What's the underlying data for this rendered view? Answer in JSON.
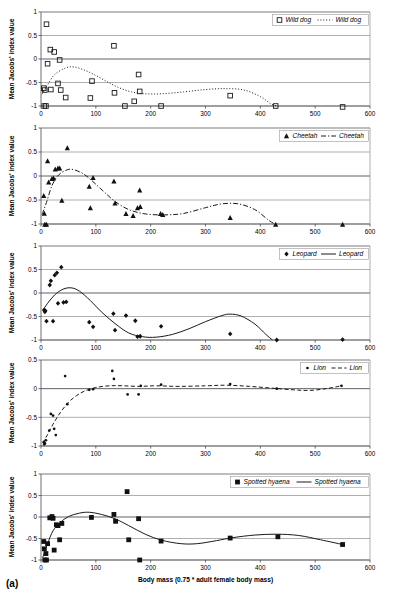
{
  "figure": {
    "caption": "(a)",
    "xlabel": "Body mass (0.75 * adult female body mass)",
    "ylabel": "Mean Jacobs' index value"
  },
  "axes": {
    "x_ticks": [
      "0",
      "100",
      "200",
      "300",
      "400",
      "500",
      "600"
    ],
    "x_values": [
      0,
      100,
      200,
      300,
      400,
      500,
      600
    ],
    "y_ticks_full": [
      "1",
      "0.5",
      "0",
      "-0.5",
      "-1"
    ],
    "y_values_full": [
      1,
      0.5,
      0,
      -0.5,
      -1
    ],
    "y_ticks_lion": [
      "0.5",
      "0",
      "-0.5",
      "-1"
    ],
    "y_values_lion": [
      0.5,
      0,
      -0.5,
      -1
    ]
  },
  "chart_data": [
    {
      "type": "scatter",
      "panel": 1,
      "title": "",
      "xlabel": "",
      "ylabel": "Mean Jacobs' index value",
      "xlim": [
        0,
        600
      ],
      "ylim": [
        -1,
        1
      ],
      "grid": true,
      "legend_position": "top-right",
      "legend": [
        {
          "label": "Wild dog",
          "kind": "marker",
          "marker": "open-square"
        },
        {
          "label": "Wild dog",
          "kind": "line",
          "linestyle": "dotted"
        }
      ],
      "marker": "open-square",
      "linestyle": "dotted",
      "points": [
        {
          "x": 10,
          "y": 0.74
        },
        {
          "x": 12,
          "y": -0.1
        },
        {
          "x": 17,
          "y": 0.2
        },
        {
          "x": 24,
          "y": 0.15
        },
        {
          "x": 34,
          "y": -0.02
        },
        {
          "x": 5,
          "y": -0.62
        },
        {
          "x": 7,
          "y": -0.66
        },
        {
          "x": 6,
          "y": -1.0
        },
        {
          "x": 9,
          "y": -1.0
        },
        {
          "x": 18,
          "y": -0.65
        },
        {
          "x": 31,
          "y": -0.52
        },
        {
          "x": 36,
          "y": -0.66
        },
        {
          "x": 45,
          "y": -0.82
        },
        {
          "x": 90,
          "y": -0.83
        },
        {
          "x": 93,
          "y": -0.47
        },
        {
          "x": 133,
          "y": 0.28
        },
        {
          "x": 134,
          "y": -0.72
        },
        {
          "x": 153,
          "y": -1.0
        },
        {
          "x": 170,
          "y": -0.9
        },
        {
          "x": 178,
          "y": -0.33
        },
        {
          "x": 180,
          "y": -0.69
        },
        {
          "x": 219,
          "y": -1.0
        },
        {
          "x": 345,
          "y": -0.78
        },
        {
          "x": 428,
          "y": -1.0
        },
        {
          "x": 550,
          "y": -1.02
        }
      ],
      "curve": [
        {
          "x": 2,
          "y": -0.75
        },
        {
          "x": 12,
          "y": -0.55
        },
        {
          "x": 25,
          "y": -0.33
        },
        {
          "x": 45,
          "y": -0.19
        },
        {
          "x": 60,
          "y": -0.17
        },
        {
          "x": 80,
          "y": -0.24
        },
        {
          "x": 100,
          "y": -0.35
        },
        {
          "x": 120,
          "y": -0.48
        },
        {
          "x": 140,
          "y": -0.6
        },
        {
          "x": 165,
          "y": -0.7
        },
        {
          "x": 190,
          "y": -0.74
        },
        {
          "x": 220,
          "y": -0.74
        },
        {
          "x": 260,
          "y": -0.7
        },
        {
          "x": 300,
          "y": -0.65
        },
        {
          "x": 335,
          "y": -0.63
        },
        {
          "x": 370,
          "y": -0.66
        },
        {
          "x": 400,
          "y": -0.8
        },
        {
          "x": 420,
          "y": -0.96
        },
        {
          "x": 432,
          "y": -1.0
        }
      ]
    },
    {
      "type": "scatter",
      "panel": 2,
      "title": "",
      "xlabel": "",
      "ylabel": "Mean Jacobs' index value",
      "xlim": [
        0,
        600
      ],
      "ylim": [
        -1,
        1
      ],
      "grid": true,
      "legend_position": "top-right",
      "legend": [
        {
          "label": "Cheetah",
          "kind": "marker",
          "marker": "filled-triangle"
        },
        {
          "label": "Cheetah",
          "kind": "line",
          "linestyle": "dash-dot"
        }
      ],
      "marker": "filled-triangle",
      "linestyle": "dash-dot",
      "points": [
        {
          "x": 5,
          "y": -0.41
        },
        {
          "x": 6,
          "y": -0.78
        },
        {
          "x": 7,
          "y": -1.01
        },
        {
          "x": 10,
          "y": -1.01
        },
        {
          "x": 12,
          "y": 0.31
        },
        {
          "x": 14,
          "y": -0.13
        },
        {
          "x": 20,
          "y": -0.06
        },
        {
          "x": 23,
          "y": -0.05
        },
        {
          "x": 26,
          "y": 0.14
        },
        {
          "x": 31,
          "y": 0.16
        },
        {
          "x": 34,
          "y": 0.16
        },
        {
          "x": 38,
          "y": -0.51
        },
        {
          "x": 48,
          "y": 0.58
        },
        {
          "x": 88,
          "y": -0.22
        },
        {
          "x": 90,
          "y": -0.67
        },
        {
          "x": 95,
          "y": -0.04
        },
        {
          "x": 133,
          "y": -0.11
        },
        {
          "x": 135,
          "y": -0.57
        },
        {
          "x": 155,
          "y": -0.79
        },
        {
          "x": 168,
          "y": -0.83
        },
        {
          "x": 176,
          "y": -0.67
        },
        {
          "x": 180,
          "y": -0.3
        },
        {
          "x": 181,
          "y": -0.64
        },
        {
          "x": 218,
          "y": -0.79
        },
        {
          "x": 222,
          "y": -0.81
        },
        {
          "x": 345,
          "y": -0.87
        },
        {
          "x": 428,
          "y": -1.01
        },
        {
          "x": 550,
          "y": -1.01
        }
      ],
      "curve": [
        {
          "x": 2,
          "y": -0.8
        },
        {
          "x": 10,
          "y": -0.55
        },
        {
          "x": 20,
          "y": -0.2
        },
        {
          "x": 32,
          "y": 0.02
        },
        {
          "x": 48,
          "y": 0.13
        },
        {
          "x": 60,
          "y": 0.13
        },
        {
          "x": 78,
          "y": 0.04
        },
        {
          "x": 95,
          "y": -0.12
        },
        {
          "x": 115,
          "y": -0.33
        },
        {
          "x": 135,
          "y": -0.53
        },
        {
          "x": 160,
          "y": -0.7
        },
        {
          "x": 190,
          "y": -0.79
        },
        {
          "x": 225,
          "y": -0.81
        },
        {
          "x": 260,
          "y": -0.78
        },
        {
          "x": 300,
          "y": -0.66
        },
        {
          "x": 330,
          "y": -0.58
        },
        {
          "x": 360,
          "y": -0.58
        },
        {
          "x": 390,
          "y": -0.7
        },
        {
          "x": 415,
          "y": -0.92
        },
        {
          "x": 428,
          "y": -1.01
        }
      ]
    },
    {
      "type": "scatter",
      "panel": 3,
      "title": "",
      "xlabel": "",
      "ylabel": "Mean Jacobs' index value",
      "xlim": [
        0,
        600
      ],
      "ylim": [
        -1,
        1
      ],
      "grid": true,
      "legend_position": "top-right",
      "legend": [
        {
          "label": "Leopard",
          "kind": "marker",
          "marker": "filled-diamond"
        },
        {
          "label": "Leopard",
          "kind": "line",
          "linestyle": "solid"
        }
      ],
      "marker": "filled-diamond",
      "linestyle": "solid",
      "points": [
        {
          "x": 6,
          "y": -0.36
        },
        {
          "x": 7,
          "y": -0.4
        },
        {
          "x": 8,
          "y": -0.38
        },
        {
          "x": 10,
          "y": -0.6
        },
        {
          "x": 16,
          "y": 0.17
        },
        {
          "x": 18,
          "y": 0.26
        },
        {
          "x": 22,
          "y": -0.6
        },
        {
          "x": 25,
          "y": 0.38
        },
        {
          "x": 29,
          "y": 0.43
        },
        {
          "x": 31,
          "y": -0.22
        },
        {
          "x": 37,
          "y": 0.55
        },
        {
          "x": 41,
          "y": -0.2
        },
        {
          "x": 46,
          "y": -0.19
        },
        {
          "x": 88,
          "y": -0.62
        },
        {
          "x": 95,
          "y": -0.72
        },
        {
          "x": 132,
          "y": -0.44
        },
        {
          "x": 135,
          "y": -0.79
        },
        {
          "x": 155,
          "y": -0.48
        },
        {
          "x": 172,
          "y": -0.59
        },
        {
          "x": 176,
          "y": -0.93
        },
        {
          "x": 181,
          "y": -0.92
        },
        {
          "x": 219,
          "y": -0.71
        },
        {
          "x": 345,
          "y": -0.87
        },
        {
          "x": 430,
          "y": -1.0
        },
        {
          "x": 550,
          "y": -0.99
        }
      ],
      "curve": [
        {
          "x": 3,
          "y": -0.37
        },
        {
          "x": 12,
          "y": -0.22
        },
        {
          "x": 25,
          "y": -0.04
        },
        {
          "x": 40,
          "y": 0.08
        },
        {
          "x": 55,
          "y": 0.11
        },
        {
          "x": 70,
          "y": 0.04
        },
        {
          "x": 90,
          "y": -0.16
        },
        {
          "x": 110,
          "y": -0.4
        },
        {
          "x": 135,
          "y": -0.65
        },
        {
          "x": 160,
          "y": -0.85
        },
        {
          "x": 185,
          "y": -0.93
        },
        {
          "x": 210,
          "y": -0.94
        },
        {
          "x": 240,
          "y": -0.88
        },
        {
          "x": 270,
          "y": -0.76
        },
        {
          "x": 300,
          "y": -0.61
        },
        {
          "x": 330,
          "y": -0.48
        },
        {
          "x": 345,
          "y": -0.45
        },
        {
          "x": 365,
          "y": -0.49
        },
        {
          "x": 390,
          "y": -0.66
        },
        {
          "x": 410,
          "y": -0.88
        },
        {
          "x": 422,
          "y": -1.0
        }
      ]
    },
    {
      "type": "scatter",
      "panel": 4,
      "title": "",
      "xlabel": "",
      "ylabel": "Mean Jacobs' index value",
      "xlim": [
        0,
        600
      ],
      "ylim": [
        -1,
        0.5
      ],
      "grid": true,
      "legend_position": "top-right",
      "legend": [
        {
          "label": "Lion",
          "kind": "marker",
          "marker": "small-dot"
        },
        {
          "label": "Lion",
          "kind": "line",
          "linestyle": "dashed"
        }
      ],
      "marker": "small-dot",
      "linestyle": "dashed",
      "points": [
        {
          "x": 5,
          "y": -0.93
        },
        {
          "x": 6,
          "y": -0.97
        },
        {
          "x": 7,
          "y": -0.95
        },
        {
          "x": 9,
          "y": -0.9
        },
        {
          "x": 15,
          "y": -0.73
        },
        {
          "x": 18,
          "y": -0.44
        },
        {
          "x": 22,
          "y": -0.47
        },
        {
          "x": 24,
          "y": -0.7
        },
        {
          "x": 27,
          "y": -0.81
        },
        {
          "x": 44,
          "y": 0.22
        },
        {
          "x": 48,
          "y": -0.27
        },
        {
          "x": 88,
          "y": -0.02
        },
        {
          "x": 95,
          "y": -0.01
        },
        {
          "x": 130,
          "y": 0.31
        },
        {
          "x": 133,
          "y": 0.17
        },
        {
          "x": 158,
          "y": -0.1
        },
        {
          "x": 178,
          "y": -0.1
        },
        {
          "x": 182,
          "y": 0.05
        },
        {
          "x": 219,
          "y": 0.07
        },
        {
          "x": 345,
          "y": 0.08
        },
        {
          "x": 430,
          "y": 0.0
        },
        {
          "x": 548,
          "y": 0.05
        }
      ],
      "curve": [
        {
          "x": 3,
          "y": -0.95
        },
        {
          "x": 12,
          "y": -0.8
        },
        {
          "x": 22,
          "y": -0.62
        },
        {
          "x": 35,
          "y": -0.42
        },
        {
          "x": 50,
          "y": -0.24
        },
        {
          "x": 65,
          "y": -0.12
        },
        {
          "x": 80,
          "y": -0.04
        },
        {
          "x": 100,
          "y": 0.02
        },
        {
          "x": 125,
          "y": 0.05
        },
        {
          "x": 150,
          "y": 0.05
        },
        {
          "x": 180,
          "y": 0.04
        },
        {
          "x": 210,
          "y": 0.05
        },
        {
          "x": 250,
          "y": 0.04
        },
        {
          "x": 300,
          "y": 0.05
        },
        {
          "x": 340,
          "y": 0.06
        },
        {
          "x": 380,
          "y": 0.04
        },
        {
          "x": 420,
          "y": 0.01
        },
        {
          "x": 460,
          "y": -0.02
        },
        {
          "x": 490,
          "y": -0.03
        },
        {
          "x": 520,
          "y": 0.0
        },
        {
          "x": 548,
          "y": 0.05
        }
      ]
    },
    {
      "type": "scatter",
      "panel": 5,
      "title": "",
      "xlabel": "Body mass (0.75 * adult female body mass)",
      "ylabel": "Mean Jacobs' index value",
      "xlim": [
        0,
        600
      ],
      "ylim": [
        -1,
        1
      ],
      "grid": true,
      "legend_position": "top-right",
      "legend": [
        {
          "label": "Spotted hyaena",
          "kind": "marker",
          "marker": "filled-square"
        },
        {
          "label": "Spotted hyaena",
          "kind": "line",
          "linestyle": "solid"
        }
      ],
      "marker": "filled-square",
      "linestyle": "solid",
      "points": [
        {
          "x": 5,
          "y": -0.57
        },
        {
          "x": 6,
          "y": -0.74
        },
        {
          "x": 7,
          "y": -1.0
        },
        {
          "x": 9,
          "y": -0.85
        },
        {
          "x": 10,
          "y": -1.0
        },
        {
          "x": 12,
          "y": -0.62
        },
        {
          "x": 16,
          "y": -0.02
        },
        {
          "x": 20,
          "y": 0.01
        },
        {
          "x": 22,
          "y": -0.03
        },
        {
          "x": 24,
          "y": -0.77
        },
        {
          "x": 28,
          "y": -0.18
        },
        {
          "x": 31,
          "y": -0.2
        },
        {
          "x": 34,
          "y": -0.53
        },
        {
          "x": 38,
          "y": -0.15
        },
        {
          "x": 92,
          "y": -0.01
        },
        {
          "x": 133,
          "y": 0.06
        },
        {
          "x": 136,
          "y": -0.1
        },
        {
          "x": 157,
          "y": 0.59
        },
        {
          "x": 160,
          "y": -0.53
        },
        {
          "x": 178,
          "y": -0.04
        },
        {
          "x": 180,
          "y": -1.0
        },
        {
          "x": 219,
          "y": -0.56
        },
        {
          "x": 345,
          "y": -0.49
        },
        {
          "x": 432,
          "y": -0.46
        },
        {
          "x": 550,
          "y": -0.64
        }
      ],
      "curve": [
        {
          "x": 3,
          "y": -0.95
        },
        {
          "x": 12,
          "y": -0.62
        },
        {
          "x": 22,
          "y": -0.32
        },
        {
          "x": 35,
          "y": -0.13
        },
        {
          "x": 50,
          "y": 0.01
        },
        {
          "x": 70,
          "y": 0.09
        },
        {
          "x": 88,
          "y": 0.11
        },
        {
          "x": 110,
          "y": 0.06
        },
        {
          "x": 135,
          "y": -0.04
        },
        {
          "x": 160,
          "y": -0.2
        },
        {
          "x": 190,
          "y": -0.4
        },
        {
          "x": 220,
          "y": -0.54
        },
        {
          "x": 255,
          "y": -0.62
        },
        {
          "x": 285,
          "y": -0.62
        },
        {
          "x": 320,
          "y": -0.55
        },
        {
          "x": 350,
          "y": -0.48
        },
        {
          "x": 390,
          "y": -0.42
        },
        {
          "x": 430,
          "y": -0.4
        },
        {
          "x": 470,
          "y": -0.43
        },
        {
          "x": 510,
          "y": -0.53
        },
        {
          "x": 550,
          "y": -0.64
        }
      ]
    }
  ]
}
